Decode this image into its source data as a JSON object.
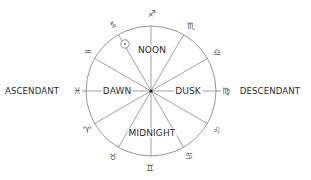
{
  "diagram": {
    "center": {
      "x": 151,
      "y": 91
    },
    "radius": 65,
    "spoke_count": 12,
    "line_color": "#8a8a8a",
    "center_dot_color": "#222222",
    "outer_labels": {
      "ascendant": "ASCENDANT",
      "descendant": "DESCENDANT"
    },
    "inner_labels": {
      "noon": "NOON",
      "dawn": "DAWN",
      "dusk": "DUSK",
      "midnight": "MIDNIGHT"
    },
    "sun_symbol": {
      "name": "sun",
      "glyph": "☉",
      "x": 125,
      "y": 44
    },
    "zodiac": [
      {
        "name": "sagittarius",
        "glyph": "♐",
        "x": 152,
        "y": 14
      },
      {
        "name": "scorpio",
        "glyph": "♏",
        "x": 191,
        "y": 26
      },
      {
        "name": "libra",
        "glyph": "♎",
        "x": 217,
        "y": 52
      },
      {
        "name": "virgo",
        "glyph": "♍",
        "x": 226,
        "y": 91
      },
      {
        "name": "leo",
        "glyph": "♌",
        "x": 217,
        "y": 130
      },
      {
        "name": "cancer",
        "glyph": "♋",
        "x": 189,
        "y": 156
      },
      {
        "name": "gemini",
        "glyph": "♊",
        "x": 150,
        "y": 168
      },
      {
        "name": "taurus",
        "glyph": "♉",
        "x": 113,
        "y": 157
      },
      {
        "name": "aries",
        "glyph": "♈",
        "x": 87,
        "y": 130
      },
      {
        "name": "pisces",
        "glyph": "♓",
        "x": 77,
        "y": 91
      },
      {
        "name": "aquarius",
        "glyph": "♒",
        "x": 88,
        "y": 52
      },
      {
        "name": "capricorn",
        "glyph": "♑",
        "x": 113,
        "y": 25
      }
    ]
  }
}
